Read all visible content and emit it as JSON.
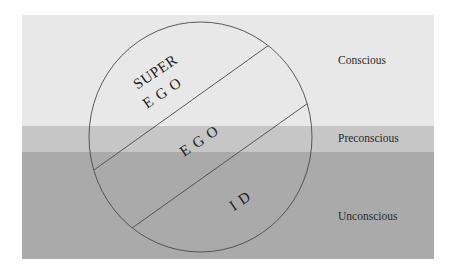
{
  "diagram": {
    "type": "freud-structural-topographical-model",
    "levels": [
      {
        "id": "conscious",
        "label": "Conscious",
        "color": "#e8e8e8"
      },
      {
        "id": "preconscious",
        "label": "Preconscious",
        "color": "#c6c6c6"
      },
      {
        "id": "unconscious",
        "label": "Unconscious",
        "color": "#aaaaaa"
      }
    ],
    "structures": [
      {
        "id": "superego",
        "line1": "SUPER",
        "line2": "E G O"
      },
      {
        "id": "ego",
        "label": "E G O"
      },
      {
        "id": "id",
        "label": "I D"
      }
    ],
    "colors": {
      "stroke": "#4a4a4a",
      "text": "#1e1e1e",
      "background": "#ffffff"
    }
  }
}
